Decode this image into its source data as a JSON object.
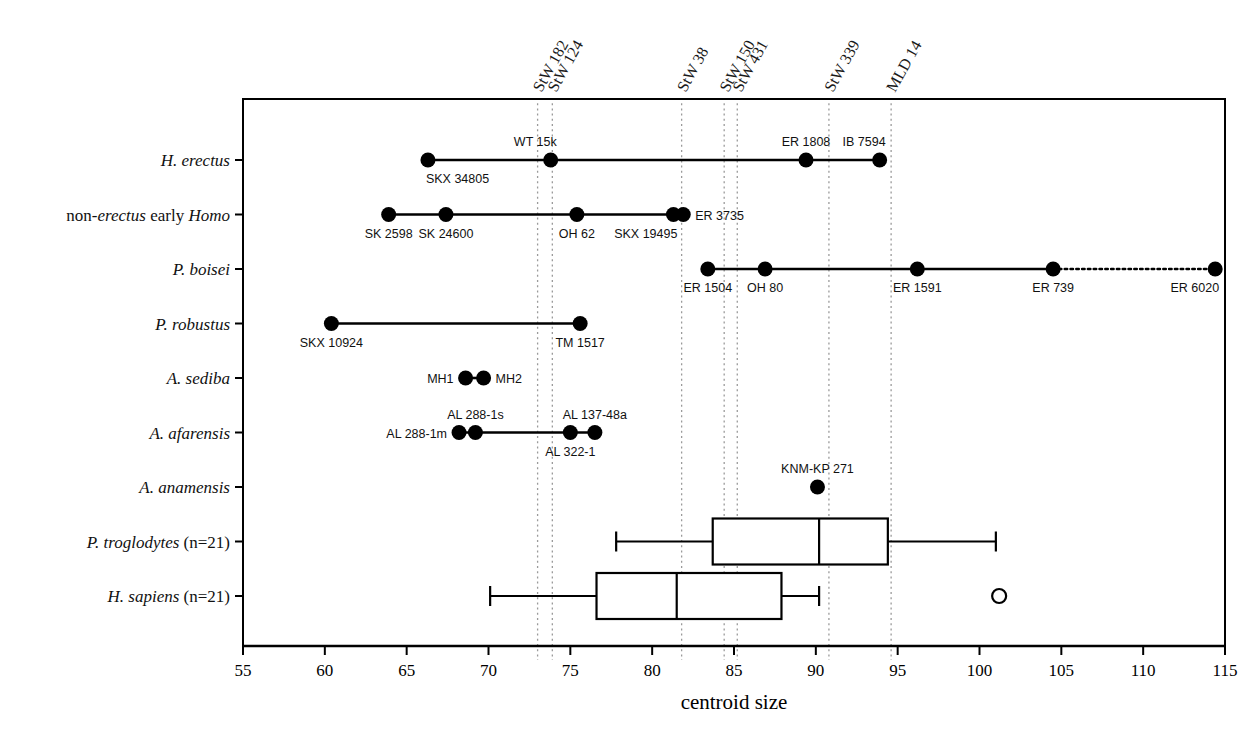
{
  "chart_data": {
    "type": "scatter",
    "title": "",
    "xlabel": "centroid size",
    "ylabel": "",
    "xlim": [
      55,
      115
    ],
    "xticks": [
      55,
      60,
      65,
      70,
      75,
      80,
      85,
      90,
      95,
      100,
      105,
      110,
      115
    ],
    "xtick_labels": [
      "55",
      "60",
      "65",
      "70",
      "75",
      "80",
      "85",
      "90",
      "95",
      "100",
      "105",
      "110",
      "115"
    ],
    "grid": false,
    "legend": "none",
    "categories": [
      "H. erectus",
      "non-erectus early Homo",
      "P. boisei",
      "P. robustus",
      "A. sediba",
      "A. afarensis",
      "A. anamensis",
      "P. troglodytes (n=21)",
      "H. sapiens (n=21)"
    ],
    "vertical_reference_lines": [
      {
        "label": "StW 182",
        "value": 73.0
      },
      {
        "label": "StW 124",
        "value": 73.9
      },
      {
        "label": "StW 38",
        "value": 81.8
      },
      {
        "label": "StW 150",
        "value": 84.4
      },
      {
        "label": "StW 431",
        "value": 85.2
      },
      {
        "label": "StW 339",
        "value": 90.8
      },
      {
        "label": "MLD 14",
        "value": 94.6
      }
    ],
    "series": [
      {
        "name": "H. erectus",
        "type": "range_with_points",
        "line": {
          "from": 66.3,
          "to": 93.9,
          "style": "solid"
        },
        "points": [
          {
            "label": "SKX 34805",
            "value": 66.3,
            "label_pos": "below-right"
          },
          {
            "label": "WT 15k",
            "value": 73.8,
            "label_pos": "above-left"
          },
          {
            "label": "ER 1808",
            "value": 89.4,
            "label_pos": "above-center"
          },
          {
            "label": "IB 7594",
            "value": 93.9,
            "label_pos": "above-left"
          }
        ]
      },
      {
        "name": "non-erectus early Homo",
        "type": "range_with_points",
        "line": {
          "from": 63.9,
          "to": 81.9,
          "style": "solid"
        },
        "points": [
          {
            "label": "SK 2598",
            "value": 63.9,
            "label_pos": "below-center"
          },
          {
            "label": "SK 24600",
            "value": 67.4,
            "label_pos": "below-center"
          },
          {
            "label": "OH 62",
            "value": 75.4,
            "label_pos": "below-center"
          },
          {
            "label": "SKX 19495",
            "value": 81.3,
            "label_pos": "below-left"
          },
          {
            "label": "ER 3735",
            "value": 81.9,
            "label_pos": "right"
          }
        ]
      },
      {
        "name": "P. boisei",
        "type": "range_with_points",
        "line": {
          "from": 83.4,
          "to": 104.5,
          "style": "solid"
        },
        "line_extension": {
          "from": 104.5,
          "to": 114.4,
          "style": "dotted"
        },
        "points": [
          {
            "label": "ER 1504",
            "value": 83.4,
            "label_pos": "below-center"
          },
          {
            "label": "OH 80",
            "value": 86.9,
            "label_pos": "below-center"
          },
          {
            "label": "ER 1591",
            "value": 96.2,
            "label_pos": "below-center"
          },
          {
            "label": "ER 739",
            "value": 104.5,
            "label_pos": "below-center"
          },
          {
            "label": "ER 6020",
            "value": 114.4,
            "label_pos": "below-left"
          }
        ]
      },
      {
        "name": "P. robustus",
        "type": "range_with_points",
        "line": {
          "from": 60.4,
          "to": 75.6,
          "style": "solid"
        },
        "points": [
          {
            "label": "SKX 10924",
            "value": 60.4,
            "label_pos": "below-center"
          },
          {
            "label": "TM 1517",
            "value": 75.6,
            "label_pos": "below-center"
          }
        ]
      },
      {
        "name": "A. sediba",
        "type": "range_with_points",
        "line": {
          "from": 68.6,
          "to": 69.7,
          "style": "solid"
        },
        "points": [
          {
            "label": "MH1",
            "value": 68.6,
            "label_pos": "left"
          },
          {
            "label": "MH2",
            "value": 69.7,
            "label_pos": "right"
          }
        ]
      },
      {
        "name": "A. afarensis",
        "type": "range_with_points",
        "line": {
          "from": 68.2,
          "to": 76.5,
          "style": "solid"
        },
        "points": [
          {
            "label": "AL 288-1m",
            "value": 68.2,
            "label_pos": "left"
          },
          {
            "label": "AL 288-1s",
            "value": 69.2,
            "label_pos": "above-center"
          },
          {
            "label": "AL 322-1",
            "value": 75.0,
            "label_pos": "below-center"
          },
          {
            "label": "AL 137-48a",
            "value": 76.5,
            "label_pos": "above-center"
          }
        ]
      },
      {
        "name": "A. anamensis",
        "type": "single_point",
        "points": [
          {
            "label": "KNM-KP 271",
            "value": 90.1,
            "label_pos": "above-center"
          }
        ]
      },
      {
        "name": "P. troglodytes (n=21)",
        "type": "boxplot",
        "box": {
          "whisker_low": 77.8,
          "q1": 83.7,
          "median": 90.2,
          "q3": 94.4,
          "whisker_high": 101.0
        },
        "outliers": []
      },
      {
        "name": "H. sapiens (n=21)",
        "type": "boxplot",
        "box": {
          "whisker_low": 70.1,
          "q1": 76.6,
          "median": 81.5,
          "q3": 87.9,
          "whisker_high": 90.2
        },
        "outliers": [
          101.2
        ]
      }
    ]
  },
  "axis": {
    "x_title": "centroid size"
  },
  "species_labels": [
    {
      "parts": [
        {
          "text": "H. erectus",
          "italic": true
        }
      ]
    },
    {
      "parts": [
        {
          "text": "non-",
          "italic": false
        },
        {
          "text": "erectus",
          "italic": true
        },
        {
          "text": " early ",
          "italic": false
        },
        {
          "text": "Homo",
          "italic": true
        }
      ]
    },
    {
      "parts": [
        {
          "text": "P. boisei",
          "italic": true
        }
      ]
    },
    {
      "parts": [
        {
          "text": "P. robustus",
          "italic": true
        }
      ]
    },
    {
      "parts": [
        {
          "text": "A. sediba",
          "italic": true
        }
      ]
    },
    {
      "parts": [
        {
          "text": "A. afarensis",
          "italic": true
        }
      ]
    },
    {
      "parts": [
        {
          "text": "A. anamensis",
          "italic": true
        }
      ]
    },
    {
      "parts": [
        {
          "text": "P. troglodytes",
          "italic": true
        },
        {
          "text": " (n=21)",
          "italic": false
        }
      ]
    },
    {
      "parts": [
        {
          "text": "H. sapiens",
          "italic": true
        },
        {
          "text": " (n=21)",
          "italic": false
        }
      ]
    }
  ],
  "colors": {
    "foreground": "#000000",
    "guide_line": "#9a9a9a",
    "background": "#ffffff"
  }
}
